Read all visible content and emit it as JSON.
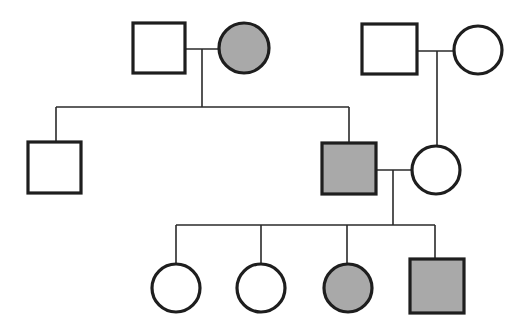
{
  "diagram": {
    "type": "pedigree-chart",
    "colors": {
      "affected_fill": "#a9a9a9",
      "unaffected_fill": "#ffffff",
      "stroke": "#1e1e1e",
      "line": "#2a2a2a"
    },
    "legend": {
      "square": "male",
      "circle": "female",
      "shaded": "affected",
      "unshaded": "unaffected"
    },
    "individuals": [
      {
        "id": "I-1",
        "generation": 1,
        "sex": "male",
        "affected": false,
        "shape": "square",
        "x": 133,
        "y": 23,
        "w": 52,
        "h": 50
      },
      {
        "id": "I-2",
        "generation": 1,
        "sex": "female",
        "affected": true,
        "shape": "circle",
        "cx": 244,
        "cy": 48,
        "r": 25
      },
      {
        "id": "I-3",
        "generation": 1,
        "sex": "male",
        "affected": false,
        "shape": "square",
        "x": 362,
        "y": 24,
        "w": 55,
        "h": 50
      },
      {
        "id": "I-4",
        "generation": 1,
        "sex": "female",
        "affected": false,
        "shape": "circle",
        "cx": 478,
        "cy": 50,
        "r": 24
      },
      {
        "id": "II-1",
        "generation": 2,
        "sex": "male",
        "affected": false,
        "shape": "square",
        "x": 28,
        "y": 142,
        "w": 53,
        "h": 51
      },
      {
        "id": "II-2",
        "generation": 2,
        "sex": "male",
        "affected": true,
        "shape": "square",
        "x": 322,
        "y": 143,
        "w": 54,
        "h": 51
      },
      {
        "id": "II-3",
        "generation": 2,
        "sex": "female",
        "affected": false,
        "shape": "circle",
        "cx": 436,
        "cy": 170,
        "r": 24
      },
      {
        "id": "III-1",
        "generation": 3,
        "sex": "female",
        "affected": false,
        "shape": "circle",
        "cx": 176,
        "cy": 288,
        "r": 24
      },
      {
        "id": "III-2",
        "generation": 3,
        "sex": "female",
        "affected": false,
        "shape": "circle",
        "cx": 261,
        "cy": 288,
        "r": 24
      },
      {
        "id": "III-3",
        "generation": 3,
        "sex": "female",
        "affected": true,
        "shape": "circle",
        "cx": 348,
        "cy": 288,
        "r": 24
      },
      {
        "id": "III-4",
        "generation": 3,
        "sex": "male",
        "affected": true,
        "shape": "square",
        "x": 410,
        "y": 259,
        "w": 54,
        "h": 54
      }
    ],
    "matings": [
      {
        "partners": [
          "I-1",
          "I-2"
        ],
        "line": [
          185,
          49,
          219,
          49
        ],
        "descent": [
          202,
          49,
          202,
          107
        ]
      },
      {
        "partners": [
          "I-3",
          "I-4"
        ],
        "line": [
          417,
          51,
          454,
          51
        ],
        "descent": [
          437,
          51,
          437,
          146
        ]
      },
      {
        "partners": [
          "II-2",
          "II-3"
        ],
        "line": [
          376,
          170,
          412,
          170
        ],
        "descent": [
          393,
          170,
          393,
          225
        ]
      }
    ],
    "sibships": [
      {
        "parents": [
          "I-1",
          "I-2"
        ],
        "bar": [
          56,
          107,
          349,
          107
        ],
        "children": [
          "II-1",
          "II-2"
        ],
        "drops": [
          [
            56,
            107,
            56,
            142
          ],
          [
            349,
            107,
            349,
            143
          ]
        ]
      },
      {
        "parents": [
          "II-2",
          "II-3"
        ],
        "bar": [
          176,
          225,
          435,
          225
        ],
        "children": [
          "III-1",
          "III-2",
          "III-3",
          "III-4"
        ],
        "drops": [
          [
            176,
            225,
            176,
            264
          ],
          [
            261,
            225,
            261,
            264
          ],
          [
            347,
            225,
            347,
            264
          ],
          [
            435,
            225,
            435,
            259
          ]
        ]
      }
    ]
  }
}
